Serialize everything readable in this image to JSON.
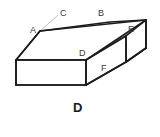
{
  "figure": {
    "caption": "D",
    "background_color": "#ffffff",
    "edge_color": "#1c1c1c",
    "face_color": "#ffffff",
    "leader_line_color": "#c0c0c0",
    "label_color": "#3a3a3a",
    "shape_name": "beveled-rectangular-prism",
    "labels": [
      {
        "id": "A",
        "text": "A",
        "x": 30,
        "y": 26
      },
      {
        "id": "B",
        "text": "B",
        "x": 98,
        "y": 9
      },
      {
        "id": "C",
        "text": "C",
        "x": 60,
        "y": 9
      },
      {
        "id": "D",
        "text": "D",
        "x": 79,
        "y": 49
      },
      {
        "id": "E",
        "text": "E",
        "x": 128,
        "y": 25
      },
      {
        "id": "F",
        "text": "F",
        "x": 101,
        "y": 64
      }
    ],
    "solid": {
      "top_face": [
        [
          16,
          60
        ],
        [
          40,
          31
        ],
        [
          110,
          22
        ],
        [
          146,
          20
        ],
        [
          126,
          36
        ],
        [
          86,
          60
        ]
      ],
      "front_face": [
        [
          16,
          60
        ],
        [
          86,
          60
        ],
        [
          86,
          85
        ],
        [
          16,
          85
        ]
      ],
      "right_face": [
        [
          86,
          60
        ],
        [
          126,
          36
        ],
        [
          146,
          20
        ],
        [
          146,
          48
        ],
        [
          126,
          62
        ],
        [
          86,
          85
        ]
      ],
      "end_cap": [
        [
          126,
          36
        ],
        [
          146,
          20
        ],
        [
          146,
          48
        ],
        [
          126,
          62
        ]
      ]
    },
    "leaders": [
      {
        "from": [
          58,
          14
        ],
        "to": [
          40,
          31
        ],
        "label": "C"
      },
      {
        "from": [
          99,
          66
        ],
        "to": [
          128,
          34
        ],
        "label": "F-upper"
      },
      {
        "from": [
          99,
          66
        ],
        "to": [
          86,
          60
        ],
        "label": "F-lower"
      }
    ]
  }
}
